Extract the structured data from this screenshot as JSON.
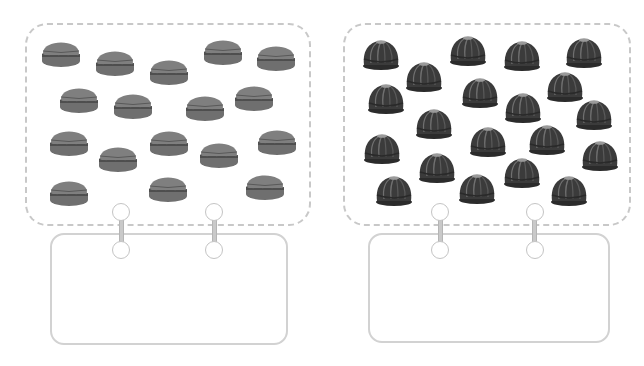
{
  "page": {
    "title_fragment": "",
    "colors": {
      "card_border": "#c8c8c8",
      "macaron_top": "#7d7d7d",
      "macaron_filling": "#555555",
      "bundt_body": "#3a3a3a",
      "ring": "#c4c4c4"
    }
  },
  "left_panel": {
    "label": "macarons",
    "count": 17,
    "icon": "macaron-icon",
    "answer_box_value": "",
    "items": [
      [
        61,
        52
      ],
      [
        115,
        61
      ],
      [
        169,
        70
      ],
      [
        223,
        50
      ],
      [
        276,
        56
      ],
      [
        79,
        98
      ],
      [
        133,
        104
      ],
      [
        205,
        106
      ],
      [
        254,
        96
      ],
      [
        69,
        141
      ],
      [
        118,
        157
      ],
      [
        169,
        141
      ],
      [
        219,
        153
      ],
      [
        277,
        140
      ],
      [
        69,
        191
      ],
      [
        168,
        187
      ],
      [
        265,
        185
      ]
    ]
  },
  "right_panel": {
    "label": "bundt cakes",
    "count": 20,
    "icon": "bundt-cake-icon",
    "answer_box_value": "",
    "items": [
      [
        381,
        54
      ],
      [
        468,
        50
      ],
      [
        522,
        55
      ],
      [
        584,
        52
      ],
      [
        424,
        76
      ],
      [
        386,
        98
      ],
      [
        480,
        92
      ],
      [
        565,
        86
      ],
      [
        523,
        107
      ],
      [
        594,
        114
      ],
      [
        434,
        123
      ],
      [
        488,
        141
      ],
      [
        547,
        139
      ],
      [
        382,
        148
      ],
      [
        437,
        167
      ],
      [
        522,
        172
      ],
      [
        600,
        155
      ],
      [
        394,
        190
      ],
      [
        477,
        188
      ],
      [
        569,
        190
      ]
    ]
  }
}
